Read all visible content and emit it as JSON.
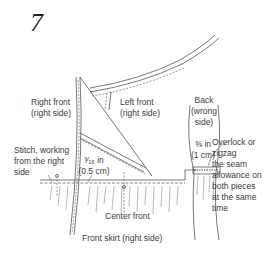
{
  "step_number": "7",
  "labels": {
    "right_front": [
      "Right front",
      "(right side)"
    ],
    "left_front": [
      "Left front",
      "(right side)"
    ],
    "back": [
      "Back",
      "(wrong",
      "side)"
    ],
    "back_allowance": [
      "⅜ in",
      "(1 cm)"
    ],
    "overlock": [
      "Overlock or",
      "zigzag",
      "the seam",
      "allowance on",
      "both pieces",
      "at the same",
      "time"
    ],
    "stitch": [
      "Stitch, working",
      "from the right",
      "side"
    ],
    "front_allowance": [
      "³⁄₁₆ in",
      "(0.5 cm)"
    ],
    "center_front": "Center front",
    "front_skirt": "Front skirt (right side)"
  }
}
